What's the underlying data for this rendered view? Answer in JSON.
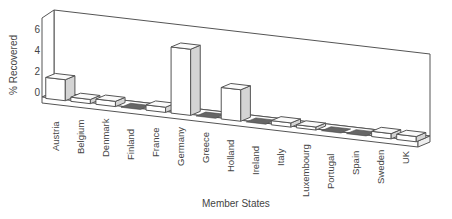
{
  "chart_data": {
    "type": "bar",
    "style": "3d",
    "title": "",
    "xlabel": "Member States",
    "ylabel": "% Recovered",
    "yticks": [
      "0",
      "2",
      "4",
      "6"
    ],
    "ylim": [
      0,
      7
    ],
    "grid": false,
    "legend": null,
    "categories": [
      "Austria",
      "Belgium",
      "Denmark",
      "Finland",
      "France",
      "Germany",
      "Greece",
      "Holland",
      "Ireland",
      "Italy",
      "Luxembourg",
      "Portugal",
      "Spain",
      "Sweden",
      "UK"
    ],
    "values": [
      2.0,
      0.4,
      0.5,
      0.0,
      0.5,
      6.3,
      0.0,
      3.0,
      0.0,
      0.4,
      0.1,
      0.0,
      0.0,
      0.5,
      0.5
    ]
  }
}
